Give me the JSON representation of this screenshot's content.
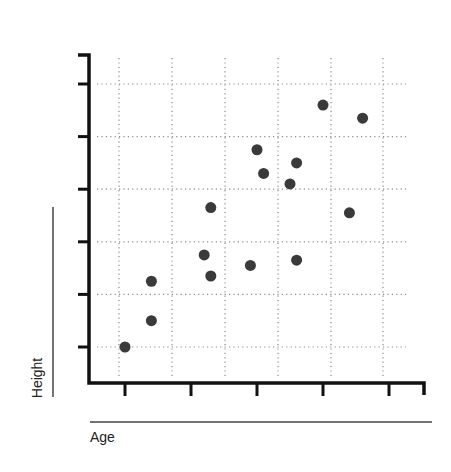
{
  "chart_data": {
    "type": "scatter",
    "title": "",
    "xlabel": "Age",
    "ylabel": "Height",
    "x_tick_labels": [],
    "y_tick_labels": [],
    "x_ticks": [
      1,
      2,
      3,
      4,
      5
    ],
    "y_ticks": [
      1,
      2,
      3,
      4,
      5,
      6
    ],
    "xlim": [
      0.45,
      5.5
    ],
    "ylim": [
      0.3,
      6.5
    ],
    "grid": true,
    "grid_style": "dotted",
    "legend": null,
    "series": [
      {
        "name": "points",
        "color": "#3a3a3a",
        "points": [
          {
            "x": 1.0,
            "y": 1.0
          },
          {
            "x": 1.4,
            "y": 1.5
          },
          {
            "x": 1.4,
            "y": 2.25
          },
          {
            "x": 2.2,
            "y": 2.75
          },
          {
            "x": 2.3,
            "y": 2.35
          },
          {
            "x": 2.3,
            "y": 3.65
          },
          {
            "x": 2.9,
            "y": 2.55
          },
          {
            "x": 3.0,
            "y": 4.75
          },
          {
            "x": 3.1,
            "y": 4.3
          },
          {
            "x": 3.5,
            "y": 4.1
          },
          {
            "x": 3.6,
            "y": 4.5
          },
          {
            "x": 3.6,
            "y": 2.65
          },
          {
            "x": 4.0,
            "y": 5.6
          },
          {
            "x": 4.4,
            "y": 3.55
          },
          {
            "x": 4.6,
            "y": 5.35
          }
        ]
      }
    ]
  },
  "colors": {
    "axis": "#111111",
    "grid": "#8a8a8a",
    "point": "#3a3a3a",
    "label_rule": "#444444"
  },
  "labels": {
    "x_axis_title": "Age",
    "y_axis_title": "Height"
  }
}
